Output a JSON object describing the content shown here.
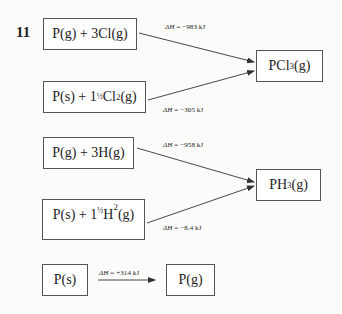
{
  "question_number": "11",
  "boxes": {
    "pg_3clg": {
      "prefix": "P(g) + 3Cl(g)"
    },
    "ps_cl2": {
      "prefix": "P(s) + 1",
      "frac": "½",
      "mid": "Cl",
      "sub": "2",
      "suffix": "(g)"
    },
    "pcl3": {
      "prefix": "PCl",
      "sub": "3",
      "suffix": "(g)"
    },
    "pg_3hg": {
      "prefix": "P(g) + 3H(g)"
    },
    "ps_h2": {
      "prefix": "P(s) + 1",
      "frac": "½",
      "mid": "H",
      "sub": "2",
      "suffix": "(g)"
    },
    "ph3": {
      "prefix": "PH",
      "sub": "3",
      "suffix": "(g)"
    },
    "ps": {
      "label": "P(s)"
    },
    "pg": {
      "label": "P(g)"
    }
  },
  "enthalpies": {
    "dh_symbol": "ΔH",
    "pg_to_pcl3": "=  −983 kJ",
    "ps_to_pcl3": "=  −305 kJ",
    "pg_to_ph3": "=  −958 kJ",
    "ps_to_ph3": "=  −8.4 kJ",
    "ps_to_pg": "=  +314 kJ"
  },
  "colors": {
    "line": "#333333",
    "border": "#555555",
    "background": "#fbfbf9"
  }
}
